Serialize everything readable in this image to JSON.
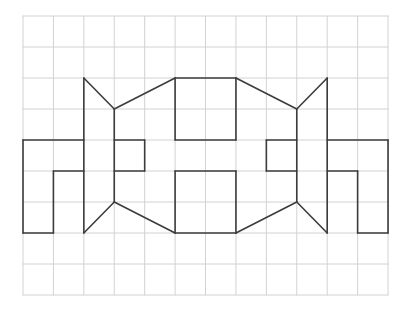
{
  "figure": {
    "grid": {
      "origin_px": [
        23,
        16
      ],
      "cell_w": 30.42,
      "cell_h": 31,
      "cols": 12,
      "rows": 9,
      "line_color": "#d2d2d2"
    },
    "stroke_color": "#3c3c3c",
    "segments": [
      [
        [
          0,
          4
        ],
        [
          2,
          4
        ]
      ],
      [
        [
          0,
          4
        ],
        [
          0,
          7
        ]
      ],
      [
        [
          0,
          7
        ],
        [
          1,
          7
        ]
      ],
      [
        [
          1,
          7
        ],
        [
          1,
          5
        ]
      ],
      [
        [
          1,
          5
        ],
        [
          2,
          5
        ]
      ],
      [
        [
          2,
          2
        ],
        [
          2,
          7
        ]
      ],
      [
        [
          2,
          2
        ],
        [
          3,
          3
        ]
      ],
      [
        [
          3,
          3
        ],
        [
          3,
          6
        ]
      ],
      [
        [
          3,
          6
        ],
        [
          2,
          7
        ]
      ],
      [
        [
          3,
          4
        ],
        [
          4,
          4
        ]
      ],
      [
        [
          4,
          4
        ],
        [
          4,
          5
        ]
      ],
      [
        [
          4,
          5
        ],
        [
          3,
          5
        ]
      ],
      [
        [
          3,
          3
        ],
        [
          5,
          2
        ]
      ],
      [
        [
          5,
          2
        ],
        [
          7,
          2
        ]
      ],
      [
        [
          5,
          2
        ],
        [
          5,
          4
        ]
      ],
      [
        [
          5,
          4
        ],
        [
          7,
          4
        ]
      ],
      [
        [
          7,
          2
        ],
        [
          7,
          4
        ]
      ],
      [
        [
          3,
          6
        ],
        [
          5,
          7
        ]
      ],
      [
        [
          5,
          7
        ],
        [
          7,
          7
        ]
      ],
      [
        [
          5,
          5
        ],
        [
          5,
          7
        ]
      ],
      [
        [
          5,
          5
        ],
        [
          7,
          5
        ]
      ],
      [
        [
          7,
          5
        ],
        [
          7,
          7
        ]
      ],
      [
        [
          7,
          7
        ],
        [
          9,
          6
        ]
      ],
      [
        [
          7,
          2
        ],
        [
          9,
          3
        ]
      ],
      [
        [
          9,
          3
        ],
        [
          10,
          2
        ]
      ],
      [
        [
          10,
          2
        ],
        [
          10,
          7
        ]
      ],
      [
        [
          9,
          3
        ],
        [
          9,
          6
        ]
      ],
      [
        [
          9,
          6
        ],
        [
          10,
          7
        ]
      ],
      [
        [
          8,
          4
        ],
        [
          9,
          4
        ]
      ],
      [
        [
          8,
          4
        ],
        [
          8,
          5
        ]
      ],
      [
        [
          8,
          5
        ],
        [
          9,
          5
        ]
      ],
      [
        [
          10,
          4
        ],
        [
          12,
          4
        ]
      ],
      [
        [
          12,
          4
        ],
        [
          12,
          7
        ]
      ],
      [
        [
          11,
          7
        ],
        [
          12,
          7
        ]
      ],
      [
        [
          11,
          5
        ],
        [
          11,
          7
        ]
      ],
      [
        [
          10,
          5
        ],
        [
          11,
          5
        ]
      ]
    ]
  }
}
